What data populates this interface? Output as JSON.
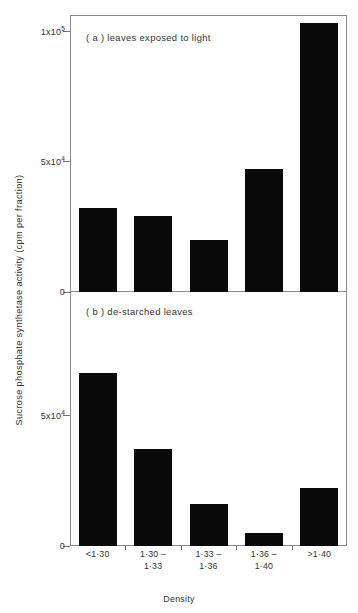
{
  "figure": {
    "y_axis_title": "Sucrose phosphate synthetase activity (cpm per fraction)",
    "x_axis_title": "Density"
  },
  "chart_data": {
    "type": "bar",
    "title": "",
    "xlabel": "Density",
    "ylabel": "Sucrose phosphate synthetase activity (cpm per fraction)",
    "categories": [
      "<1·30",
      "1·30 –\n1·33",
      "1·33 –\n1·36",
      "1·36 –\n1·40",
      ">1·40"
    ],
    "panels": [
      {
        "id": "a",
        "caption": "( a )  leaves exposed to light",
        "values": [
          32000,
          29000,
          20000,
          47000,
          103000
        ],
        "ylim": [
          0,
          106000
        ],
        "yticks": [
          0,
          50000,
          100000
        ],
        "ytick_labels": [
          "0",
          "5x10",
          "1x10"
        ],
        "ytick_exponents": [
          "",
          "4",
          "5"
        ],
        "grid": false
      },
      {
        "id": "b",
        "caption": "( b )  de-starched leaves",
        "values": [
          66000,
          37000,
          16000,
          5000,
          22000
        ],
        "ylim": [
          0,
          97000
        ],
        "yticks": [
          0,
          50000
        ],
        "ytick_labels": [
          "0",
          "5x10"
        ],
        "ytick_exponents": [
          "",
          "4"
        ],
        "grid": false
      }
    ],
    "legend": null,
    "legend_position": "none"
  },
  "colors": {
    "bar": "#0a0a0a",
    "axis": "#8a8a8a",
    "text": "#333333",
    "background": "#ffffff"
  }
}
